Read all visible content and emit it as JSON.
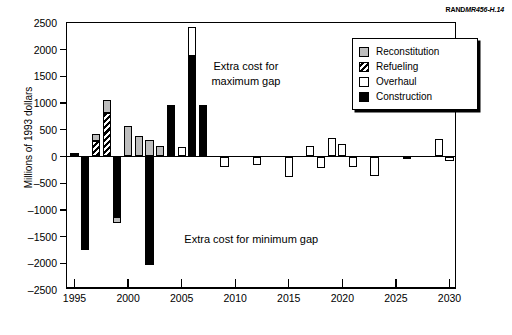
{
  "credit": {
    "bold": "RAND",
    "italic": "MR456-H.14"
  },
  "chart_data": {
    "type": "bar",
    "stacked": true,
    "title": "",
    "xlabel": "",
    "ylabel": "Millions of 1993 dollars",
    "xlim": [
      1994.3,
      2030.7
    ],
    "ylim": [
      -2500,
      2500
    ],
    "ytick_labels": [
      "2500",
      "2000",
      "1500",
      "1000",
      "500",
      "0",
      "-500",
      "-1000",
      "-1500",
      "-2000",
      "-2500"
    ],
    "ytick_values": [
      2500,
      2000,
      1500,
      1000,
      500,
      0,
      -500,
      -1000,
      -1500,
      -2000,
      -2500
    ],
    "xtick_labels": [
      "1995",
      "2000",
      "2005",
      "2010",
      "2015",
      "2020",
      "2025",
      "2030"
    ],
    "xtick_values": [
      1995,
      2000,
      2005,
      2010,
      2015,
      2020,
      2025,
      2030
    ],
    "grid": false,
    "legend_position": "top-right",
    "series": [
      {
        "name": "Reconstitution",
        "color": "#bdbdbd",
        "pattern": "solid"
      },
      {
        "name": "Refueling",
        "color": "#000000",
        "pattern": "hatch"
      },
      {
        "name": "Overhaul",
        "color": "#ffffff",
        "pattern": "solid"
      },
      {
        "name": "Construction",
        "color": "#000000",
        "pattern": "solid"
      }
    ],
    "categories": [
      1995,
      1996,
      1997,
      1998,
      1999,
      2000,
      2001,
      2002,
      2003,
      2004,
      2005,
      2006,
      2007,
      2008,
      2009,
      2010,
      2011,
      2012,
      2013,
      2014,
      2015,
      2016,
      2017,
      2018,
      2019,
      2020,
      2021,
      2022,
      2023,
      2024,
      2025,
      2026,
      2027,
      2028,
      2029,
      2030
    ],
    "bars": [
      {
        "year": 1995,
        "segments": [
          {
            "series": "Construction",
            "from": 0,
            "to": 60
          }
        ]
      },
      {
        "year": 1996,
        "segments": [
          {
            "series": "Construction",
            "from": 0,
            "to": -1760
          }
        ]
      },
      {
        "year": 1997,
        "segments": [
          {
            "series": "Refueling",
            "from": 0,
            "to": 290
          },
          {
            "series": "Reconstitution",
            "from": 290,
            "to": 430
          }
        ]
      },
      {
        "year": 1998,
        "segments": [
          {
            "series": "Refueling",
            "from": 0,
            "to": 810
          },
          {
            "series": "Reconstitution",
            "from": 810,
            "to": 1055
          }
        ]
      },
      {
        "year": 1999,
        "segments": [
          {
            "series": "Construction",
            "from": 0,
            "to": -1130
          },
          {
            "series": "Reconstitution",
            "from": -1130,
            "to": -1245
          }
        ]
      },
      {
        "year": 2000,
        "segments": [
          {
            "series": "Reconstitution",
            "from": 0,
            "to": 580
          }
        ]
      },
      {
        "year": 2001,
        "segments": [
          {
            "series": "Reconstitution",
            "from": 0,
            "to": 380
          }
        ]
      },
      {
        "year": 2002,
        "segments": [
          {
            "series": "Reconstitution",
            "from": 0,
            "to": 305
          },
          {
            "series": "Construction",
            "from": 0,
            "to": -2030
          }
        ]
      },
      {
        "year": 2003,
        "segments": [
          {
            "series": "Reconstitution",
            "from": 0,
            "to": 205
          }
        ]
      },
      {
        "year": 2004,
        "segments": [
          {
            "series": "Construction",
            "from": 0,
            "to": 965
          }
        ]
      },
      {
        "year": 2005,
        "segments": [
          {
            "series": "Overhaul",
            "from": 0,
            "to": 180
          }
        ]
      },
      {
        "year": 2006,
        "segments": [
          {
            "series": "Construction",
            "from": 0,
            "to": 1890
          },
          {
            "series": "Overhaul",
            "from": 1890,
            "to": 2420
          }
        ]
      },
      {
        "year": 2007,
        "segments": [
          {
            "series": "Construction",
            "from": 0,
            "to": 960
          }
        ]
      },
      {
        "year": 2009,
        "segments": [
          {
            "series": "Overhaul",
            "from": 0,
            "to": -200
          }
        ]
      },
      {
        "year": 2012,
        "segments": [
          {
            "series": "Overhaul",
            "from": 0,
            "to": -160
          }
        ]
      },
      {
        "year": 2015,
        "segments": [
          {
            "series": "Overhaul",
            "from": 0,
            "to": -380
          }
        ]
      },
      {
        "year": 2017,
        "segments": [
          {
            "series": "Overhaul",
            "from": 0,
            "to": 190
          }
        ]
      },
      {
        "year": 2018,
        "segments": [
          {
            "series": "Overhaul",
            "from": 0,
            "to": -210
          }
        ]
      },
      {
        "year": 2019,
        "segments": [
          {
            "series": "Overhaul",
            "from": 0,
            "to": 350
          }
        ]
      },
      {
        "year": 2020,
        "segments": [
          {
            "series": "Overhaul",
            "from": 0,
            "to": 235
          }
        ]
      },
      {
        "year": 2021,
        "segments": [
          {
            "series": "Overhaul",
            "from": 0,
            "to": -205
          }
        ]
      },
      {
        "year": 2023,
        "segments": [
          {
            "series": "Overhaul",
            "from": 0,
            "to": -370
          }
        ]
      },
      {
        "year": 2026,
        "segments": [
          {
            "series": "Overhaul",
            "from": 0,
            "to": -40
          }
        ]
      },
      {
        "year": 2029,
        "segments": [
          {
            "series": "Overhaul",
            "from": 0,
            "to": 330
          }
        ]
      },
      {
        "year": 2030,
        "segments": [
          {
            "series": "Overhaul",
            "from": 0,
            "to": -75
          }
        ]
      }
    ],
    "annotations": [
      {
        "id": "max-gap",
        "line1": "Extra cost for",
        "line2": "maximum gap",
        "x": 2011.0,
        "y": 1550
      },
      {
        "id": "min-gap",
        "line1": "Extra cost for minimum gap",
        "x": 2011.5,
        "y": -1550
      }
    ]
  },
  "legend": {
    "items": [
      {
        "label": "Reconstitution",
        "key": "reconstitution"
      },
      {
        "label": "Refueling",
        "key": "refueling"
      },
      {
        "label": "Overhaul",
        "key": "overhaul"
      },
      {
        "label": "Construction",
        "key": "construction"
      }
    ]
  }
}
